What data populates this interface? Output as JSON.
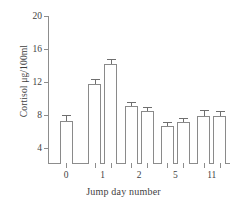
{
  "chart_data": {
    "type": "bar",
    "title": "",
    "xlabel": "Jump day number",
    "ylabel": "Cortisol μg/100ml",
    "categories": [
      "0",
      "1",
      "2",
      "5",
      "11"
    ],
    "ylim": [
      2,
      20
    ],
    "yticks": [
      4,
      8,
      12,
      16,
      20
    ],
    "ytick_labels": [
      "4",
      "8",
      "12",
      "16",
      "20"
    ],
    "grid": false,
    "legend": false,
    "groups": [
      {
        "category": "0",
        "bars": [
          {
            "value": 7.2,
            "error": 0.7
          }
        ]
      },
      {
        "category": "1",
        "bars": [
          {
            "value": 11.7,
            "error": 0.6
          },
          {
            "value": 14.2,
            "error": 0.6
          }
        ]
      },
      {
        "category": "2",
        "bars": [
          {
            "value": 9.1,
            "error": 0.5
          },
          {
            "value": 8.4,
            "error": 0.5
          }
        ]
      },
      {
        "category": "5",
        "bars": [
          {
            "value": 6.6,
            "error": 0.5
          },
          {
            "value": 7.1,
            "error": 0.5
          }
        ]
      },
      {
        "category": "11",
        "bars": [
          {
            "value": 7.8,
            "error": 0.8
          },
          {
            "value": 7.8,
            "error": 0.6
          }
        ]
      }
    ],
    "series": [
      {
        "name": "bar-1",
        "values": [
          7.2,
          11.7,
          9.1,
          6.6,
          7.8
        ]
      },
      {
        "name": "bar-2",
        "values": [
          null,
          14.2,
          8.4,
          7.1,
          7.8
        ]
      }
    ],
    "colors": {
      "bar_fill": "#ffffff",
      "bar_edge": "#8a8a8a",
      "axis": "#8d8d8d",
      "text": "#3f3f3f",
      "background": "#ffffff"
    }
  }
}
